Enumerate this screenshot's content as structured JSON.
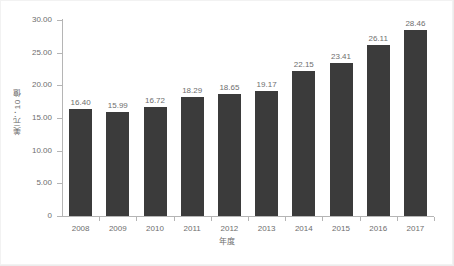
{
  "chart_data": {
    "type": "bar",
    "title": "",
    "subtitle": "",
    "xlabel": "年度",
    "ylabel": "美元：10 億",
    "categories": [
      "2008",
      "2009",
      "2010",
      "2011",
      "2012",
      "2013",
      "2014",
      "2015",
      "2016",
      "2017"
    ],
    "values": [
      16.4,
      15.99,
      16.72,
      18.29,
      18.65,
      19.17,
      22.15,
      23.41,
      26.11,
      28.46
    ],
    "value_labels": [
      "16.40",
      "15.99",
      "16.72",
      "18.29",
      "18.65",
      "19.17",
      "22.15",
      "23.41",
      "26.11",
      "28.46"
    ],
    "ylim": [
      0,
      30
    ],
    "ytick_values": [
      0,
      5,
      10,
      15,
      20,
      25,
      30
    ],
    "ytick_labels": [
      "0",
      "5.00",
      "10.00",
      "15.00",
      "20.00",
      "25.00",
      "30.00"
    ],
    "grid": false,
    "legend": null,
    "legend_position": "none",
    "series": [
      {
        "name": "",
        "values": [
          16.4,
          15.99,
          16.72,
          18.29,
          18.65,
          19.17,
          22.15,
          23.41,
          26.11,
          28.46
        ],
        "color": "#3b3b3b"
      }
    ]
  },
  "colors": {
    "bar": "#3b3b3b",
    "axis": "#b5b5b5",
    "text": "#6e6e6e",
    "background": "#ffffff",
    "frame": "#ececec"
  }
}
